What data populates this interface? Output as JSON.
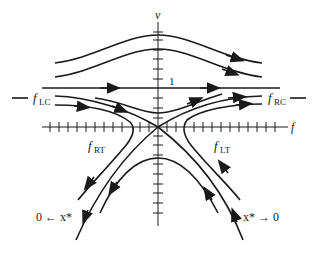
{
  "diagram": {
    "type": "phase-portrait",
    "axes": {
      "vertical_label": "v",
      "horizontal_label": "f",
      "level_marker": "1"
    },
    "separatrix_labels": {
      "left_center_main": "f",
      "left_center_sub": "LC",
      "right_center_main": "f",
      "right_center_sub": "RC",
      "right_turn_main": "f",
      "right_turn_sub": "RT",
      "left_turn_main": "f",
      "left_turn_sub": "LT"
    },
    "limit_labels": {
      "left": "0 ← x*",
      "right": "x* → 0"
    },
    "colors": {
      "ink": "#1a1a1a",
      "background": "#ffffff"
    }
  }
}
